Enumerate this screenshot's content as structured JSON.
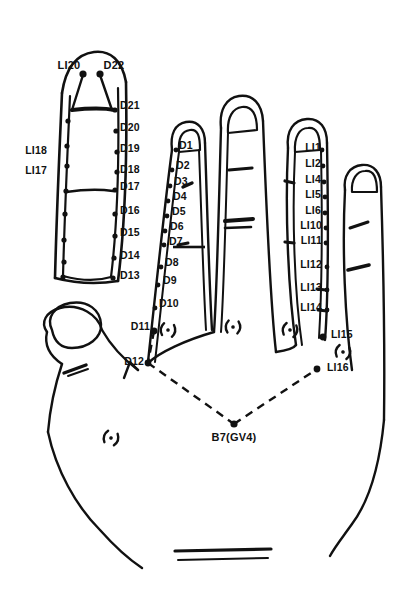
{
  "figure": {
    "ink_color": "#111111",
    "background_color": "#ffffff"
  },
  "labels": {
    "thumb_tip_left": "LI20",
    "thumb_tip_right": "D22",
    "thumb_left_upper": "LI18",
    "thumb_left_lower": "LI17",
    "b7": "B7(GV4)"
  },
  "series": {
    "d_thumb": [
      {
        "name": "D21",
        "x": 120,
        "y": 105,
        "dot_x": 109,
        "dot_y": 109
      },
      {
        "name": "D20",
        "x": 120,
        "y": 127,
        "dot_x": 110,
        "dot_y": 131
      },
      {
        "name": "D19",
        "x": 120,
        "y": 148,
        "dot_x": 111,
        "dot_y": 152
      },
      {
        "name": "D18",
        "x": 120,
        "y": 169,
        "dot_x": 112,
        "dot_y": 173
      },
      {
        "name": "D17",
        "x": 120,
        "y": 186,
        "dot_x": 112,
        "dot_y": 190
      },
      {
        "name": "D16",
        "x": 120,
        "y": 210,
        "dot_x": 113,
        "dot_y": 214
      },
      {
        "name": "D15",
        "x": 120,
        "y": 232,
        "dot_x": 114,
        "dot_y": 236
      },
      {
        "name": "D14",
        "x": 120,
        "y": 255,
        "dot_x": 115,
        "dot_y": 259
      },
      {
        "name": "D13",
        "x": 120,
        "y": 275,
        "dot_x": 116,
        "dot_y": 279
      }
    ],
    "d_index": [
      {
        "name": "D1",
        "x": 178,
        "y": 145,
        "dot_x": 172,
        "dot_y": 149
      },
      {
        "name": "D2",
        "x": 176,
        "y": 165,
        "dot_x": 169,
        "dot_y": 169
      },
      {
        "name": "D3",
        "x": 174,
        "y": 181,
        "dot_x": 167,
        "dot_y": 185
      },
      {
        "name": "D4",
        "x": 173,
        "y": 196,
        "dot_x": 166,
        "dot_y": 200
      },
      {
        "name": "D5",
        "x": 172,
        "y": 211,
        "dot_x": 165,
        "dot_y": 215
      },
      {
        "name": "D6",
        "x": 170,
        "y": 226,
        "dot_x": 163,
        "dot_y": 230
      },
      {
        "name": "D7",
        "x": 169,
        "y": 240,
        "dot_x": 162,
        "dot_y": 244
      },
      {
        "name": "D8",
        "x": 165,
        "y": 262,
        "dot_x": 158,
        "dot_y": 266
      },
      {
        "name": "D9",
        "x": 163,
        "y": 280,
        "dot_x": 156,
        "dot_y": 284
      },
      {
        "name": "D10",
        "x": 159,
        "y": 303,
        "dot_x": 152,
        "dot_y": 307
      },
      {
        "name": "D11",
        "x": 128,
        "y": 326,
        "dot_x": 152,
        "dot_y": 330
      },
      {
        "name": "D12",
        "x": 119,
        "y": 361,
        "dot_x": 146,
        "dot_y": 365
      }
    ],
    "li_ring": [
      {
        "name": "LI1",
        "x": 303,
        "y": 145,
        "dot_x": 318,
        "dot_y": 149
      },
      {
        "name": "LI2",
        "x": 303,
        "y": 161,
        "dot_x": 319,
        "dot_y": 165
      },
      {
        "name": "LI4",
        "x": 301,
        "y": 177,
        "dot_x": 320,
        "dot_y": 181
      },
      {
        "name": "LI5",
        "x": 303,
        "y": 192,
        "dot_x": 321,
        "dot_y": 196
      },
      {
        "name": "LI6",
        "x": 303,
        "y": 208,
        "dot_x": 322,
        "dot_y": 212
      },
      {
        "name": "LI10",
        "x": 299,
        "y": 223,
        "dot_x": 323,
        "dot_y": 227
      },
      {
        "name": "LI11",
        "x": 297,
        "y": 238,
        "dot_x": 324,
        "dot_y": 242
      },
      {
        "name": "LI12",
        "x": 296,
        "y": 262,
        "dot_x": 325,
        "dot_y": 266
      },
      {
        "name": "LI13",
        "x": 294,
        "y": 285,
        "dot_x": 326,
        "dot_y": 289
      },
      {
        "name": "LI14",
        "x": 294,
        "y": 305,
        "dot_x": 327,
        "dot_y": 309
      },
      {
        "name": "LI15",
        "x": 331,
        "y": 332,
        "dot_x": 326,
        "dot_y": 336
      },
      {
        "name": "LI16",
        "x": 331,
        "y": 365,
        "dot_x": 320,
        "dot_y": 369
      }
    ]
  }
}
